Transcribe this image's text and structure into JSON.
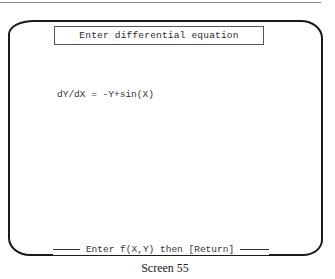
{
  "screen": {
    "title": "Enter differential equation",
    "equation_line": "dY/dX = -Y+sin(X)",
    "prompt": "Enter f(X,Y) then [Return]"
  },
  "caption": "Screen 55"
}
